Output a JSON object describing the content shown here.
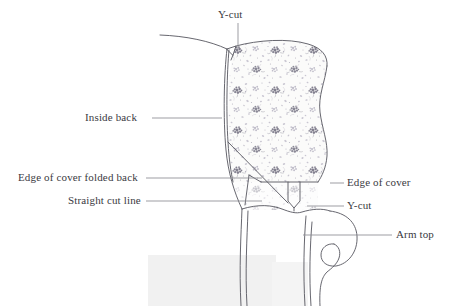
{
  "figure": {
    "background_color": "#ffffff",
    "ink_color": "#4a4a55",
    "leader_line_color": "#8b8b93",
    "text_color": "#3a3a42",
    "fabric": {
      "base_color": "#fbfbfa",
      "flower_dark_color": "#6e6b7d",
      "flower_light_color": "#b9b6c4",
      "stem_color": "#9a97a6"
    },
    "shadow_color": "#f0f0f0"
  },
  "labels": {
    "y_cut_top": "Y-cut",
    "inside_back": "Inside back",
    "edge_of_cover_folded_back": "Edge of cover folded back",
    "straight_cut_line": "Straight cut line",
    "edge_of_cover": "Edge of cover",
    "y_cut_right": "Y-cut",
    "arm_top": "Arm top"
  }
}
